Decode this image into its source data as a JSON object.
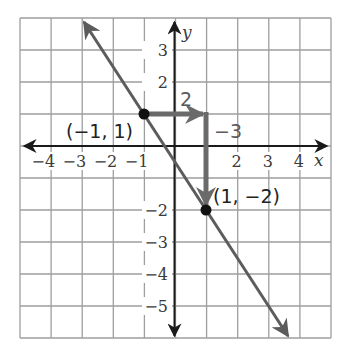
{
  "graph": {
    "x_axis_label": "x",
    "y_axis_label": "y",
    "x_ticks": [
      {
        "value": -4,
        "label": "−4"
      },
      {
        "value": -3,
        "label": "−3"
      },
      {
        "value": -2,
        "label": "−2"
      },
      {
        "value": -1,
        "label": "−1"
      },
      {
        "value": 2,
        "label": "2"
      },
      {
        "value": 3,
        "label": "3"
      },
      {
        "value": 4,
        "label": "4"
      }
    ],
    "y_ticks": [
      {
        "value": 3,
        "label": "3"
      },
      {
        "value": 2,
        "label": "2"
      },
      {
        "value": -2,
        "label": "−2"
      },
      {
        "value": -3,
        "label": "−3"
      },
      {
        "value": -4,
        "label": "−4"
      },
      {
        "value": -5,
        "label": "−5"
      }
    ],
    "points": [
      {
        "x": -1,
        "y": 1,
        "label": "(−1, 1)"
      },
      {
        "x": 1,
        "y": -2,
        "label": "(1, −2)"
      }
    ],
    "run_label": "2",
    "rise_label": "−3",
    "colors": {
      "grid": "#9e9e9e",
      "axis": "#1a1a1a",
      "line": "#5c5c5c",
      "slope_arrows": "#6a6a6a",
      "point": "#111111"
    }
  },
  "chart_data": {
    "type": "line",
    "title": "",
    "xlabel": "x",
    "ylabel": "y",
    "xlim": [
      -5,
      5
    ],
    "ylim": [
      -6,
      4
    ],
    "grid": true,
    "series": [
      {
        "name": "line",
        "x": [
          -3,
          4
        ],
        "y": [
          4,
          -6.5
        ],
        "slope": -1.5,
        "y_intercept": -0.5
      }
    ],
    "points": [
      {
        "x": -1,
        "y": 1,
        "label": "(−1, 1)"
      },
      {
        "x": 1,
        "y": -2,
        "label": "(1, −2)"
      }
    ],
    "annotations": [
      {
        "type": "run_arrow",
        "from": [
          -1,
          1
        ],
        "to": [
          1,
          1
        ],
        "label": "2"
      },
      {
        "type": "rise_arrow",
        "from": [
          1,
          1
        ],
        "to": [
          1,
          -2
        ],
        "label": "−3"
      }
    ]
  }
}
